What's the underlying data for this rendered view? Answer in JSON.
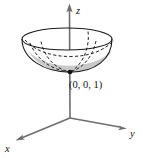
{
  "figure": {
    "background_color": "#ffffff",
    "axes": {
      "z": {
        "label": "z",
        "label_x": 76,
        "label_y": 13,
        "from_x": 70,
        "from_y": 118,
        "to_x": 69.5,
        "to_y": 8,
        "arrow": "up"
      },
      "y": {
        "label": "y",
        "label_x": 131,
        "label_y": 135,
        "from_x": 70,
        "from_y": 118,
        "to_x": 126,
        "to_y": 128,
        "arrow": "right-down"
      },
      "x": {
        "label": "x",
        "label_x": 6,
        "label_y": 151,
        "from_x": 70,
        "from_y": 118,
        "to_x": 17,
        "to_y": 140,
        "arrow": "left-down"
      },
      "axis_color": "#6e6e6e"
    },
    "surface": {
      "kind": "paraboloid",
      "outline_color": "#1a1a1a",
      "fill_upper_color": "#fbfbfb",
      "fill_lower_color": "#c9c9c9",
      "rim_center_x": 67,
      "rim_center_y": 39,
      "rim_radius_x": 45,
      "rim_radius_y": 11,
      "vertex_x": 70,
      "vertex_y": 72,
      "hidden_curve_style": "dashed"
    },
    "point": {
      "label": "(0, 0, 1)",
      "label_x": 70,
      "label_y": 87,
      "marker_x": 70,
      "marker_y": 72,
      "marker_radius": 2.3,
      "marker_color": "#111111"
    }
  }
}
